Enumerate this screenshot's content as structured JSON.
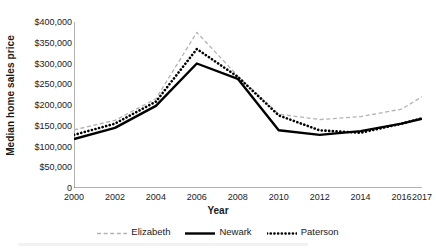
{
  "chart_data": {
    "type": "line",
    "title": "",
    "xlabel": "Year",
    "ylabel": "Median home sales price",
    "x": [
      2000,
      2002,
      2004,
      2006,
      2008,
      2010,
      2012,
      2014,
      2016,
      2017
    ],
    "xtick_labels": [
      "2000",
      "2002",
      "2004",
      "2006",
      "2008",
      "2010",
      "2012",
      "2014",
      "2016",
      "2017"
    ],
    "ytick_labels": [
      "$400,000",
      "$350,000",
      "$300,000",
      "$250,000",
      "$200,000",
      "$150,000",
      "$100,000",
      "$50,000",
      "0"
    ],
    "ytick_values": [
      400000,
      350000,
      300000,
      250000,
      200000,
      150000,
      100000,
      50000,
      0
    ],
    "ylim": [
      0,
      400000
    ],
    "xlim": [
      2000,
      2017
    ],
    "grid": false,
    "legend_position": "bottom",
    "series": [
      {
        "name": "Elizabeth",
        "style": "dashed",
        "color": "#b3b3b3",
        "values": [
          140000,
          163000,
          215000,
          375000,
          270000,
          178000,
          165000,
          172000,
          190000,
          220000
        ]
      },
      {
        "name": "Newark",
        "style": "solid",
        "color": "#000000",
        "values": [
          118000,
          145000,
          198000,
          300000,
          263000,
          139000,
          128000,
          137000,
          155000,
          167000
        ]
      },
      {
        "name": "Paterson",
        "style": "dotted",
        "color": "#000000",
        "values": [
          128000,
          155000,
          208000,
          335000,
          268000,
          175000,
          139000,
          133000,
          155000,
          168000
        ]
      }
    ]
  },
  "axes": {
    "x_axis_label": "Year",
    "y_axis_label": "Median home sales price"
  }
}
